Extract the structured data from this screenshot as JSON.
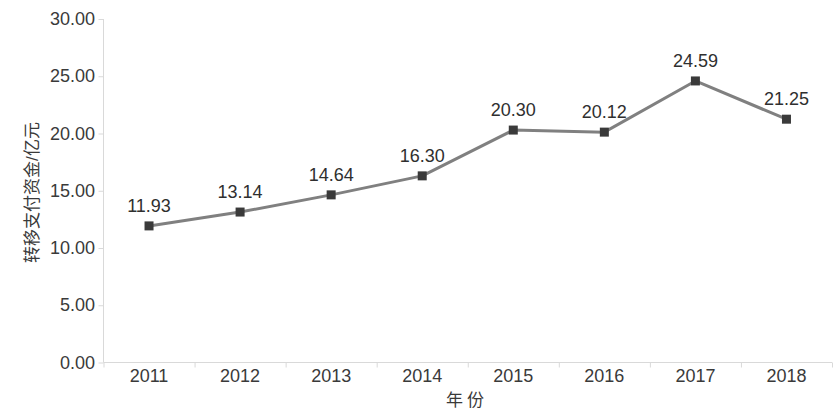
{
  "chart_data": {
    "type": "line",
    "title": "",
    "subtitle": "",
    "xlabel": "年 份",
    "ylabel": "转移支付资金/亿元",
    "categories": [
      "2011",
      "2012",
      "2013",
      "2014",
      "2015",
      "2016",
      "2017",
      "2018"
    ],
    "series": [
      {
        "name": "转移支付资金",
        "values": [
          11.93,
          13.14,
          14.64,
          16.3,
          20.3,
          20.12,
          24.59,
          21.25
        ]
      }
    ],
    "point_labels": [
      "11.93",
      "13.14",
      "14.64",
      "16.30",
      "20.30",
      "20.12",
      "24.59",
      "21.25"
    ],
    "ylim": [
      0,
      30
    ],
    "ytick_values": [
      0,
      5,
      10,
      15,
      20,
      25,
      30
    ],
    "ytick_labels": [
      "0.00",
      "5.00",
      "10.00",
      "15.00",
      "20.00",
      "25.00",
      "30.00"
    ],
    "grid": false,
    "legend": false,
    "legend_position": "none",
    "marker": "square",
    "colors": {
      "line": "#808080",
      "marker": "#3a3a3a",
      "axis": "#d9d9d9",
      "text": "#3a3a3a",
      "background": "#ffffff"
    }
  }
}
